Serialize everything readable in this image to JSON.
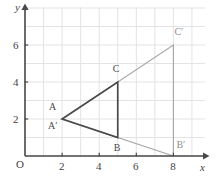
{
  "figure": {
    "axis_labels": {
      "x": "x",
      "y": "y",
      "origin": "O"
    },
    "colors": {
      "grid": "#e3e3e6",
      "axis": "#4a4a4a",
      "preimage_stroke": "#4a4a4a",
      "image_stroke": "#a6a6a6",
      "text": "#3f3f3f"
    }
  },
  "chart_data": {
    "type": "scatter",
    "xlabel": "x",
    "ylabel": "y",
    "xlim": [
      0,
      9.7
    ],
    "ylim": [
      0,
      8.05
    ],
    "grid": true,
    "grid_step": 1,
    "legend": "none",
    "xticks": [
      2,
      4,
      6,
      8
    ],
    "yticks": [
      2,
      4,
      6
    ],
    "xtick_labels": [
      "2",
      "4",
      "6",
      "8"
    ],
    "ytick_labels": [
      "2",
      "4",
      "6"
    ],
    "series": [
      {
        "name": "Triangle ABC",
        "style": "dark-solid",
        "closed": true,
        "points": [
          {
            "label": "A",
            "x": 2,
            "y": 2
          },
          {
            "label": "C",
            "x": 5,
            "y": 4
          },
          {
            "label": "B",
            "x": 5,
            "y": 1
          }
        ]
      },
      {
        "name": "Triangle A'B'C'",
        "style": "light-solid",
        "closed": true,
        "points": [
          {
            "label": "A′",
            "x": 2,
            "y": 2
          },
          {
            "label": "C′",
            "x": 8,
            "y": 6
          },
          {
            "label": "B′",
            "x": 8,
            "y": 0
          }
        ]
      }
    ],
    "annotations": [
      {
        "name": "label-A",
        "text": "A",
        "x": 2,
        "y": 2,
        "dx": -13,
        "dy": -12,
        "tone": "dark"
      },
      {
        "name": "label-Ap",
        "text": "A′",
        "x": 2,
        "y": 2,
        "dx": -14,
        "dy": 7,
        "tone": "dark"
      },
      {
        "name": "label-B",
        "text": "B",
        "x": 5,
        "y": 1,
        "dx": -4,
        "dy": 10,
        "tone": "dark"
      },
      {
        "name": "label-C",
        "text": "C",
        "x": 5,
        "y": 4,
        "dx": -5,
        "dy": -13,
        "tone": "dark"
      },
      {
        "name": "label-Bp",
        "text": "B′",
        "x": 8,
        "y": 0,
        "dx": 3,
        "dy": -11,
        "tone": "light"
      },
      {
        "name": "label-Cp",
        "text": "C′",
        "x": 8,
        "y": 6,
        "dx": 1,
        "dy": -13,
        "tone": "light"
      }
    ]
  }
}
